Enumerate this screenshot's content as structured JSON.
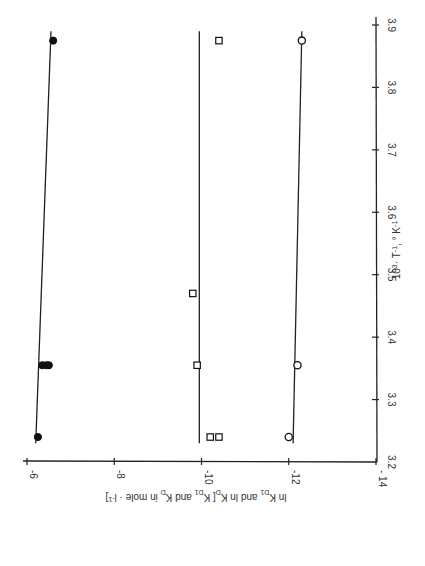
{
  "chart_data": {
    "type": "scatter",
    "orientation": "rotated 90 degrees clockwise (x axis vertical on right, y axis horizontal along bottom)",
    "title": "",
    "xlabel": "10^3 · T^-1 , °K^-1",
    "ylabel": "ln K_D1 and ln K_D[K_D1 and K_D in mole · l^-1]",
    "xlim": [
      3.2,
      3.9
    ],
    "ylim": [
      -14,
      -6
    ],
    "x_ticks": [
      "3.2",
      "3.3",
      "3.4",
      "3.5",
      "3.6",
      "3.7",
      "3.8",
      "3.9"
    ],
    "y_ticks": [
      "-6",
      "-8",
      "-10",
      "-12",
      "-14"
    ],
    "grid": false,
    "legend": null,
    "series": [
      {
        "name": "filled circles",
        "marker": "filled-circle",
        "points": [
          {
            "x": 3.24,
            "y": -6.25
          },
          {
            "x": 3.355,
            "y": -6.35
          },
          {
            "x": 3.355,
            "y": -6.45
          },
          {
            "x": 3.355,
            "y": -6.5
          },
          {
            "x": 3.875,
            "y": -6.6
          }
        ],
        "fit_line": {
          "x": [
            3.23,
            3.89
          ],
          "y": [
            -6.2,
            -6.55
          ]
        }
      },
      {
        "name": "open squares",
        "marker": "open-square",
        "points": [
          {
            "x": 3.24,
            "y": -10.2
          },
          {
            "x": 3.24,
            "y": -10.4
          },
          {
            "x": 3.355,
            "y": -9.9
          },
          {
            "x": 3.47,
            "y": -9.8
          },
          {
            "x": 3.875,
            "y": -10.4
          }
        ],
        "fit_line": {
          "x": [
            3.23,
            3.89
          ],
          "y": [
            -9.95,
            -9.95
          ]
        }
      },
      {
        "name": "open circles",
        "marker": "open-circle",
        "points": [
          {
            "x": 3.24,
            "y": -12.0
          },
          {
            "x": 3.355,
            "y": -12.2
          },
          {
            "x": 3.875,
            "y": -12.3
          }
        ],
        "fit_line": {
          "x": [
            3.23,
            3.89
          ],
          "y": [
            -12.1,
            -12.3
          ]
        }
      }
    ]
  },
  "axes": {
    "x_axis_label_parts": {
      "base": "10",
      "exp1": "3",
      "mid": "· T",
      "exp2": "-1",
      "unit": ", ° K",
      "exp3": "-1"
    },
    "y_axis_label": "ln K_D1 and ln K_D[K_D1 and K_D in mole · l^-1]",
    "x_tick_labels": [
      "3.2",
      "3.3",
      "3.4",
      "3.5",
      "3.6",
      "3.7",
      "3.8",
      "3.9"
    ],
    "y_tick_labels": [
      "-6",
      "-8",
      "-10",
      "-12",
      "-14"
    ]
  }
}
